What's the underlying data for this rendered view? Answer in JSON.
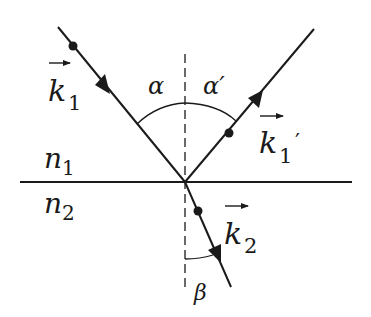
{
  "diagram": {
    "media": {
      "upper": {
        "symbol": "n",
        "subscript": "1"
      },
      "lower": {
        "symbol": "n",
        "subscript": "2"
      }
    },
    "rays": {
      "incident": {
        "symbol": "k",
        "subscript": "1",
        "prime": ""
      },
      "reflected": {
        "symbol": "k",
        "subscript": "1",
        "prime": "′"
      },
      "refracted": {
        "symbol": "k",
        "subscript": "2",
        "prime": ""
      }
    },
    "angles": {
      "incidence": "α",
      "reflection": "α′",
      "refraction": "β"
    },
    "colors": {
      "line": "#1a1a1a",
      "background": "#ffffff"
    }
  }
}
